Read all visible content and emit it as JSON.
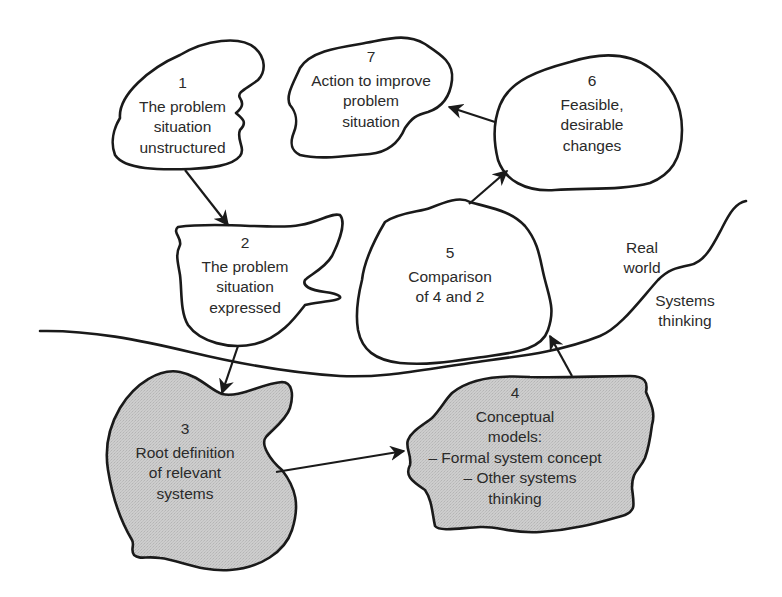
{
  "diagram": {
    "nodes": [
      {
        "id": "1",
        "number": "1",
        "lines": [
          "The problem",
          "situation",
          "unstructured"
        ],
        "fill": "white",
        "region": "real-world"
      },
      {
        "id": "2",
        "number": "2",
        "lines": [
          "The problem",
          "situation",
          "expressed"
        ],
        "fill": "white",
        "region": "real-world"
      },
      {
        "id": "3",
        "number": "3",
        "lines": [
          "Root definition",
          "of relevant",
          "systems"
        ],
        "fill": "gray",
        "region": "systems-thinking"
      },
      {
        "id": "4",
        "number": "4",
        "lines": [
          "Conceptual",
          "models:",
          "– Formal system concept",
          "– Other systems",
          "thinking"
        ],
        "fill": "gray",
        "region": "systems-thinking"
      },
      {
        "id": "5",
        "number": "5",
        "lines": [
          "Comparison",
          "of 4 and 2"
        ],
        "fill": "white",
        "region": "real-world"
      },
      {
        "id": "6",
        "number": "6",
        "lines": [
          "Feasible,",
          "desirable",
          "changes"
        ],
        "fill": "white",
        "region": "real-world"
      },
      {
        "id": "7",
        "number": "7",
        "lines": [
          "Action to improve",
          "problem",
          "situation"
        ],
        "fill": "white",
        "region": "real-world"
      }
    ],
    "edges": [
      {
        "from": "1",
        "to": "2"
      },
      {
        "from": "2",
        "to": "3"
      },
      {
        "from": "3",
        "to": "4"
      },
      {
        "from": "4",
        "to": "5"
      },
      {
        "from": "5",
        "to": "6"
      },
      {
        "from": "6",
        "to": "7"
      }
    ],
    "regions": {
      "real_world": {
        "lines": [
          "Real",
          "world"
        ]
      },
      "systems_thinking": {
        "lines": [
          "Systems",
          "thinking"
        ]
      }
    },
    "colors": {
      "stroke": "#1a1a1a",
      "text": "#2a2a2a",
      "gray_fill": "#c8c8c8",
      "background": "#ffffff"
    }
  }
}
